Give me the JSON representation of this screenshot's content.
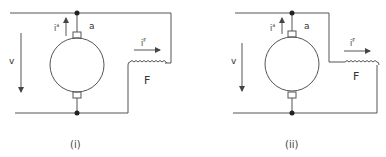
{
  "figure": {
    "line_color": "#444444",
    "diagrams": [
      {
        "id": "i",
        "caption": "(i)",
        "labels": {
          "voltage": "v",
          "armature_current": "i",
          "armature_current_sup": "a",
          "armature_terminal": "a",
          "field_current": "i",
          "field_current_sup": "F",
          "field_winding": "F"
        }
      },
      {
        "id": "ii",
        "caption": "(ii)",
        "labels": {
          "voltage": "v",
          "armature_current": "i",
          "armature_current_sup": "a",
          "armature_terminal": "a",
          "field_current": "i",
          "field_current_sup": "F",
          "field_winding": "F"
        }
      }
    ]
  }
}
